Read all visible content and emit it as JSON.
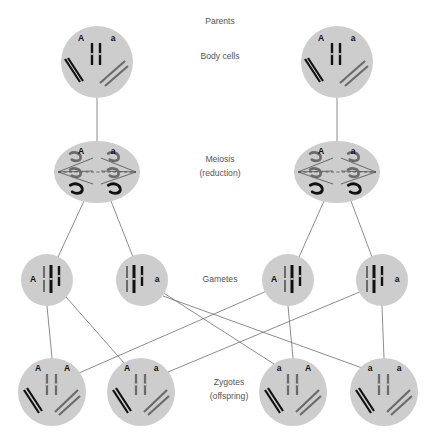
{
  "figure": {
    "background_color": "#ffffff",
    "cell_fill": "#cdcdcd",
    "chromosome_dark_color": "#111111",
    "chromosome_grey_color": "#6b6b6b",
    "connector_color": "#6e6e6e",
    "label_color": "#555555"
  },
  "stage_labels": [
    {
      "id": "parents",
      "text": "Parents",
      "x": 220,
      "y": 22
    },
    {
      "id": "body-cells",
      "text": "Body cells",
      "x": 220,
      "y": 57
    },
    {
      "id": "meiosis",
      "text": "Meiosis",
      "x": 220,
      "y": 160
    },
    {
      "id": "meiosis-reduction",
      "text": "(reduction)",
      "x": 220,
      "y": 174
    },
    {
      "id": "gametes",
      "text": "Gametes",
      "x": 220,
      "y": 280
    },
    {
      "id": "zygotes",
      "text": "Zygotes",
      "x": 229,
      "y": 383
    },
    {
      "id": "zygotes-offspring",
      "text": "(offspring)",
      "x": 229,
      "y": 397
    }
  ],
  "parent_cells": [
    {
      "id": "parent-left",
      "cx": 97,
      "cy": 62,
      "r": 36,
      "allele_left": "A",
      "allele_right": "a",
      "allele_left_x": 81,
      "allele_right_x": 113,
      "allele_y": 39
    },
    {
      "id": "parent-right",
      "cx": 337,
      "cy": 62,
      "r": 36,
      "allele_left": "A",
      "allele_right": "a",
      "allele_left_x": 321,
      "allele_right_x": 353,
      "allele_y": 39
    }
  ],
  "meiosis_cells": [
    {
      "id": "meiosis-left",
      "cx": 97,
      "cy": 172,
      "rx": 43,
      "ry": 31,
      "allele_left": "A",
      "allele_right": "a",
      "allele_left_x": 81,
      "allele_right_x": 113,
      "allele_y": 152
    },
    {
      "id": "meiosis-right",
      "cx": 337,
      "cy": 172,
      "rx": 43,
      "ry": 31,
      "allele_left": "A",
      "allele_right": "a",
      "allele_left_x": 321,
      "allele_right_x": 353,
      "allele_y": 152
    }
  ],
  "gamete_cells": [
    {
      "id": "gamete-1",
      "cx": 47,
      "cy": 280,
      "r": 26,
      "allele": "A",
      "allele_side": "left",
      "allele_x": 33,
      "allele_y": 280
    },
    {
      "id": "gamete-2",
      "cx": 142,
      "cy": 280,
      "r": 26,
      "allele": "a",
      "allele_side": "right",
      "allele_x": 157,
      "allele_y": 280
    },
    {
      "id": "gamete-3",
      "cx": 288,
      "cy": 280,
      "r": 26,
      "allele": "A",
      "allele_side": "left",
      "allele_x": 274,
      "allele_y": 280
    },
    {
      "id": "gamete-4",
      "cx": 382,
      "cy": 280,
      "r": 26,
      "allele": "a",
      "allele_side": "right",
      "allele_x": 397,
      "allele_y": 280
    }
  ],
  "zygote_cells": [
    {
      "id": "zygote-1",
      "cx": 52,
      "cy": 392,
      "r": 34,
      "genotype": "A A",
      "allele_left": "A",
      "allele_right": "A",
      "allele_left_x": 38,
      "allele_right_x": 67,
      "allele_y": 369
    },
    {
      "id": "zygote-2",
      "cx": 141,
      "cy": 392,
      "r": 34,
      "genotype": "A a",
      "allele_left": "A",
      "allele_right": "a",
      "allele_left_x": 127,
      "allele_right_x": 156,
      "allele_y": 369
    },
    {
      "id": "zygote-3",
      "cx": 293,
      "cy": 392,
      "r": 34,
      "genotype": "a A",
      "allele_left": "a",
      "allele_right": "A",
      "allele_left_x": 279,
      "allele_right_x": 308,
      "allele_y": 369
    },
    {
      "id": "zygote-4",
      "cx": 384,
      "cy": 392,
      "r": 34,
      "genotype": "a a",
      "allele_left": "a",
      "allele_right": "a",
      "allele_left_x": 370,
      "allele_right_x": 399,
      "allele_y": 369
    }
  ],
  "connectors": {
    "parent_to_meiosis": [
      {
        "id": "conn-parent-left-meiosis",
        "x1": 97,
        "y1": 98,
        "x2": 97,
        "y2": 141
      },
      {
        "id": "conn-parent-right-meiosis",
        "x1": 337,
        "y1": 98,
        "x2": 337,
        "y2": 141
      }
    ],
    "meiosis_to_gametes": [
      {
        "id": "conn-mL-g1",
        "x1": 84,
        "y1": 201,
        "x2": 58,
        "y2": 257
      },
      {
        "id": "conn-mL-g2",
        "x1": 111,
        "y1": 201,
        "x2": 133,
        "y2": 257
      },
      {
        "id": "conn-mR-g3",
        "x1": 324,
        "y1": 201,
        "x2": 299,
        "y2": 257
      },
      {
        "id": "conn-mR-g4",
        "x1": 351,
        "y1": 201,
        "x2": 372,
        "y2": 257
      }
    ],
    "fertilization": [
      {
        "id": "conn-g1-z1",
        "x1": 47,
        "y1": 306,
        "x2": 52,
        "y2": 358
      },
      {
        "id": "conn-g3-z3",
        "x1": 288,
        "y1": 306,
        "x2": 293,
        "y2": 358
      },
      {
        "id": "conn-g4-z4",
        "x1": 382,
        "y1": 306,
        "x2": 384,
        "y2": 358
      },
      {
        "id": "conn-g1-z2",
        "x1": 66,
        "y1": 297,
        "x2": 125,
        "y2": 364
      },
      {
        "id": "conn-g2-z3",
        "x1": 162,
        "y1": 292,
        "x2": 274,
        "y2": 364
      },
      {
        "id": "conn-g2-z4",
        "x1": 163,
        "y1": 296,
        "x2": 365,
        "y2": 369
      },
      {
        "id": "conn-g3-z1",
        "x1": 269,
        "y1": 290,
        "x2": 79,
        "y2": 373
      },
      {
        "id": "conn-g4-z2",
        "x1": 362,
        "y1": 291,
        "x2": 168,
        "y2": 372
      }
    ]
  }
}
